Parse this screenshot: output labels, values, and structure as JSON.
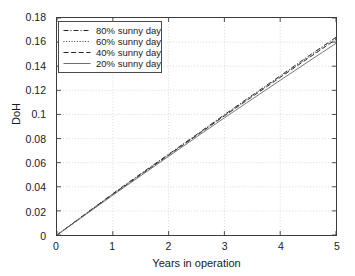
{
  "chart_data": {
    "type": "line",
    "title": "",
    "xlabel": "Years in operation",
    "ylabel": "DoH",
    "xlim": [
      0,
      5
    ],
    "ylim": [
      0,
      0.18
    ],
    "grid": true,
    "legend_position": "upper left",
    "xticks": [
      "0",
      "1",
      "2",
      "3",
      "4",
      "5"
    ],
    "xtick_values": [
      0,
      1,
      2,
      3,
      4,
      5
    ],
    "yticks": [
      "0",
      "0.02",
      "0.04",
      "0.06",
      "0.08",
      "0.1",
      "0.12",
      "0.14",
      "0.16",
      "0.18"
    ],
    "ytick_values": [
      0,
      0.02,
      0.04,
      0.06,
      0.08,
      0.1,
      0.12,
      0.14,
      0.16,
      0.18
    ],
    "x": [
      0,
      0.5,
      1,
      1.5,
      2,
      2.5,
      3,
      3.5,
      4,
      4.5,
      5
    ],
    "series": [
      {
        "name": "80% sunny day",
        "style": "dashdot",
        "color": "#262626",
        "values": [
          0,
          0.0172,
          0.0343,
          0.0508,
          0.067,
          0.0833,
          0.0998,
          0.116,
          0.132,
          0.1482,
          0.164
        ]
      },
      {
        "name": "60% sunny day",
        "style": "dotted",
        "color": "#262626",
        "values": [
          0,
          0.017,
          0.034,
          0.0504,
          0.0666,
          0.0829,
          0.0993,
          0.1154,
          0.1314,
          0.1474,
          0.1632
        ]
      },
      {
        "name": "40% sunny day",
        "style": "dashed",
        "color": "#262626",
        "values": [
          0,
          0.0168,
          0.0337,
          0.05,
          0.0662,
          0.0825,
          0.0988,
          0.1148,
          0.1307,
          0.1466,
          0.1622
        ]
      },
      {
        "name": "20% sunny day",
        "style": "solid",
        "color": "#6e6e6e",
        "values": [
          0,
          0.0165,
          0.033,
          0.0491,
          0.0652,
          0.0813,
          0.0972,
          0.1128,
          0.1283,
          0.1437,
          0.159
        ]
      }
    ]
  },
  "legend": {
    "items": [
      {
        "label": "80% sunny day",
        "style": "dashdot"
      },
      {
        "label": "60% sunny day",
        "style": "dotted"
      },
      {
        "label": "40% sunny day",
        "style": "dashed"
      },
      {
        "label": "20% sunny day",
        "style": "solid"
      }
    ]
  },
  "colors": {
    "axis": "#3c3c3c",
    "grid": "#c8c8c8",
    "series_dark": "#262626",
    "series_gray": "#6e6e6e",
    "background": "#ffffff"
  }
}
